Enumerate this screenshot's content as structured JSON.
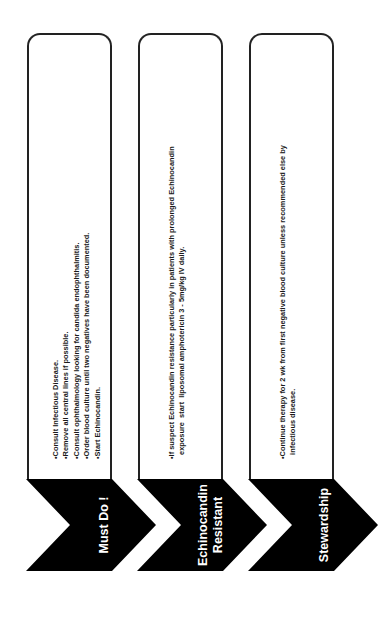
{
  "colors": {
    "chevron_fill": "#000000",
    "chevron_text": "#ffffff",
    "box_border": "#222222",
    "box_text": "#1a1a1a",
    "background": "#ffffff"
  },
  "steps": [
    {
      "label_lines": [
        "Must Do !"
      ],
      "bullets": [
        "•Consult  Infectious Disease.",
        "•Remove all central lines if possible.",
        "•Consult ophthalmology looking for candida endophthalmitis.",
        "•Order blood culture until two negatives have been documented.",
        "•Start Echinocandin."
      ]
    },
    {
      "label_lines": [
        "Echinocandin",
        "Resistant"
      ],
      "bullets": [
        "•If suspect Echinocandin resistance particularly in patients with prolonged Echinocandin",
        "  exposure  start  liposomal amphotericin 3 - 5mg/kg IV daily."
      ]
    },
    {
      "label_lines": [
        "Stewardship"
      ],
      "bullets": [
        "•Continue therapy for 2 wk  from first negative blood culture unless recommended else by",
        "  infectious disease."
      ]
    }
  ]
}
